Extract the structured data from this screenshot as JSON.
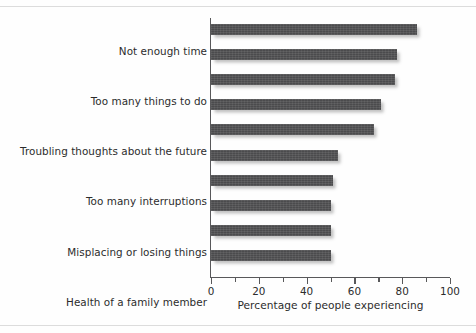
{
  "chart_data": {
    "type": "bar",
    "orientation": "horizontal",
    "title": "",
    "xlabel": "Percentage of people experiencing",
    "ylabel": "",
    "xlim": [
      0,
      100
    ],
    "xticks": [
      0,
      20,
      40,
      60,
      80,
      100
    ],
    "xtick_labels": [
      "0",
      "20",
      "40",
      "60",
      "80",
      "100"
    ],
    "minor_xticks": [
      10,
      30,
      50,
      70,
      90
    ],
    "grid": false,
    "legend": false,
    "bar_color": "#4d4d4f",
    "categories": [
      "Not enough time",
      "Too many things to do",
      "Troubling thoughts about the future",
      "Too many interruptions",
      "Misplacing or losing things",
      "Health of a family member",
      "Social obligations",
      "Concerns about standards",
      "Concerns about getting ahead",
      "Too many responsibilities"
    ],
    "values": [
      86,
      78,
      77,
      71,
      68,
      53,
      51,
      50,
      50,
      50
    ]
  }
}
